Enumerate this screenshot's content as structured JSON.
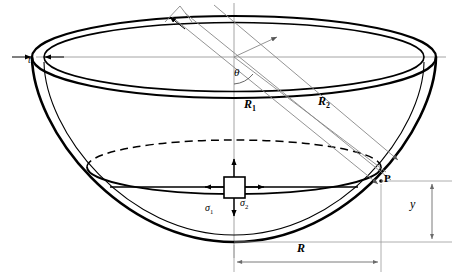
{
  "figure": {
    "labels": {
      "thickness": "t",
      "angle": "θ",
      "radius_1_base": "R",
      "radius_1_sub": "1",
      "radius_2_base": "R",
      "radius_2_sub": "2",
      "stress_1_base": "σ",
      "stress_1_sub": "1",
      "stress_2_base": "σ",
      "stress_2_sub": "2",
      "point": "P",
      "depth": "y",
      "radius": "R"
    },
    "colors": {
      "outline": "#000000",
      "construction_line": "#808080",
      "dimension_line": "#8c8c8c",
      "background": "#ffffff"
    },
    "geometry": {
      "rim_outer_cx": 234,
      "rim_outer_cy": 57,
      "rim_outer_rx": 202,
      "rim_outer_ry": 41,
      "rim_inner_rx": 190,
      "rim_inner_ry": 35,
      "mid_ellipse_cx": 234,
      "mid_ellipse_cy": 167,
      "mid_ellipse_rx": 147,
      "mid_ellipse_ry": 27,
      "apex_x": 234,
      "apex_y": 242,
      "point_p_x": 381,
      "point_p_y": 181
    }
  }
}
